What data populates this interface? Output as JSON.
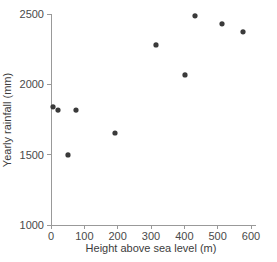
{
  "chart_data": {
    "type": "scatter",
    "title": "",
    "xlabel": "Height above sea level (m)",
    "ylabel": "Yearly rainfall (mm)",
    "xlim": [
      0,
      600
    ],
    "ylim": [
      1000,
      2500
    ],
    "xticks": [
      0,
      100,
      200,
      300,
      400,
      500,
      600
    ],
    "yticks": [
      1000,
      1500,
      2000,
      2500
    ],
    "xtick_labels": [
      "0",
      "100",
      "200",
      "300",
      "400",
      "500",
      "600"
    ],
    "ytick_labels": [
      "1000",
      "1500",
      "2000",
      "2500"
    ],
    "grid": false,
    "legend": false,
    "marker": "filled-circle",
    "marker_color": "#3a3a3a",
    "axis_color": "#999999",
    "series": [
      {
        "name": "Rainfall vs altitude",
        "points": [
          {
            "x": 6,
            "y": 1840
          },
          {
            "x": 21,
            "y": 1817
          },
          {
            "x": 51,
            "y": 1498
          },
          {
            "x": 75,
            "y": 1817
          },
          {
            "x": 192,
            "y": 1654
          },
          {
            "x": 315,
            "y": 2280
          },
          {
            "x": 402,
            "y": 2067
          },
          {
            "x": 432,
            "y": 2487
          },
          {
            "x": 513,
            "y": 2430
          },
          {
            "x": 576,
            "y": 2373
          }
        ]
      }
    ]
  },
  "plot": {
    "x_axis_title": "Height above sea level (m)",
    "y_axis_title": "Yearly rainfall (mm)"
  }
}
